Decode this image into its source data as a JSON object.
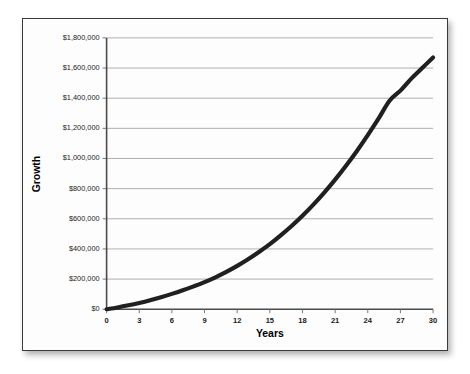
{
  "chart_data": {
    "type": "line",
    "title": "",
    "subtitle": "",
    "xlabel": "Years",
    "ylabel": "Growth",
    "grid": "horizontal",
    "legend": "none",
    "xlim": [
      0,
      30
    ],
    "ylim": [
      0,
      1800000
    ],
    "x_tick_labels": [
      "0",
      "3",
      "6",
      "9",
      "12",
      "15",
      "18",
      "21",
      "24",
      "27",
      "30"
    ],
    "x_tick_values": [
      0,
      3,
      6,
      9,
      12,
      15,
      18,
      21,
      24,
      27,
      30
    ],
    "y_tick_labels": [
      "$0",
      "$200,000",
      "$400,000",
      "$600,000",
      "$800,000",
      "$1,000,000",
      "$1,200,000",
      "$1,400,000",
      "$1,600,000",
      "$1,800,000"
    ],
    "y_tick_values": [
      0,
      200000,
      400000,
      600000,
      800000,
      1000000,
      1200000,
      1400000,
      1600000,
      1800000
    ],
    "series": [
      {
        "name": "Growth",
        "color": "#211f1f",
        "x": [
          0,
          1,
          2,
          3,
          4,
          5,
          6,
          7,
          8,
          9,
          10,
          11,
          12,
          13,
          14,
          15,
          16,
          17,
          18,
          19,
          20,
          21,
          22,
          23,
          24,
          25,
          26,
          27,
          28,
          29,
          30
        ],
        "values": [
          0,
          12000,
          26000,
          42000,
          60000,
          80000,
          102000,
          126000,
          152000,
          180000,
          212000,
          248000,
          288000,
          332000,
          380000,
          432000,
          490000,
          552000,
          620000,
          694000,
          774000,
          860000,
          952000,
          1050000,
          1155000,
          1266000,
          1383000,
          1450000,
          1530000,
          1600000,
          1670000
        ]
      }
    ]
  },
  "figure": {
    "background_color": "#fdfdfd",
    "border_color": "#3a3a3a",
    "gridline_color": "#9b9b9b",
    "axis_color": "#4a4a4a"
  }
}
